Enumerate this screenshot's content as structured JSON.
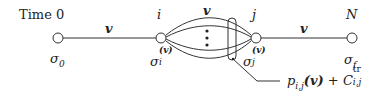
{
  "diagram": {
    "time_label": "Time",
    "time_start": "0",
    "nodes": [
      {
        "id": "sigma0",
        "top_label": "",
        "bottom_label": "σ",
        "bottom_sub": "0",
        "bottom_sup": ""
      },
      {
        "id": "sigma_i",
        "top_label": "i",
        "bottom_label": "σ",
        "bottom_sub": "i",
        "bottom_sup": "(v)"
      },
      {
        "id": "sigma_j",
        "top_label": "j",
        "bottom_label": "σ",
        "bottom_sub": "j",
        "bottom_sup": "(v)"
      },
      {
        "id": "sigma_f",
        "top_label": "N",
        "bottom_label": "σ",
        "bottom_sub": "f",
        "bottom_sup": ""
      }
    ],
    "edges": [
      {
        "from": "sigma0",
        "to": "sigma_i",
        "label": "v"
      },
      {
        "from": "sigma_i",
        "to": "sigma_j",
        "label": "v",
        "parallel": true
      },
      {
        "from": "sigma_j",
        "to": "sigma_f",
        "label": "v"
      }
    ],
    "annotation": {
      "p": "p",
      "p_sub": "i,j",
      "p_arg": "(v)",
      "plus": " + ",
      "C": "C",
      "C_sup": "tr",
      "C_sub": "i,j"
    },
    "colors": {
      "stroke": "#333333",
      "text": "#222222"
    }
  }
}
